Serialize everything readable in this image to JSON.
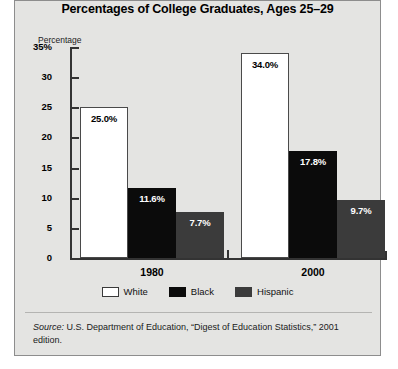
{
  "chart_data": {
    "type": "bar",
    "title": "Percentages of College Graduates, Ages 25–29",
    "xlabel": "",
    "ylabel": "Percentage",
    "ylim": [
      0,
      35
    ],
    "yticks": [
      {
        "value": 35,
        "label": "35%"
      },
      {
        "value": 30,
        "label": "30"
      },
      {
        "value": 25,
        "label": "25"
      },
      {
        "value": 20,
        "label": "20"
      },
      {
        "value": 15,
        "label": "15"
      },
      {
        "value": 10,
        "label": "10"
      },
      {
        "value": 5,
        "label": "5"
      },
      {
        "value": 0,
        "label": "0"
      }
    ],
    "grid": false,
    "legend_position": "bottom-center",
    "categories": [
      "1980",
      "2000"
    ],
    "series": [
      {
        "name": "White",
        "color": "#ffffff",
        "values": [
          25.0,
          34.0
        ],
        "labels": [
          "25.0%",
          "34.0%"
        ]
      },
      {
        "name": "Black",
        "color": "#0b0b0b",
        "values": [
          11.6,
          17.8
        ],
        "labels": [
          "11.6%",
          "17.8%"
        ]
      },
      {
        "name": "Hispanic",
        "color": "#3b3b3b",
        "values": [
          7.7,
          9.7
        ],
        "labels": [
          "7.7%",
          "9.7%"
        ]
      }
    ]
  },
  "source": {
    "prefix": "Source:",
    "text": " U.S. Department of Education, “Digest of Education Statistics,” 2001 edition."
  }
}
